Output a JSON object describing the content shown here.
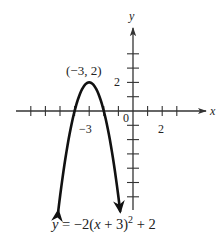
{
  "chart_data": {
    "type": "line",
    "title": "",
    "equation": "y = −2(x + 3)² + 2",
    "equation_parts": {
      "lhs": "y",
      "eq": " = −2(",
      "x": "x",
      "mid": " + 3)",
      "exp": "2",
      "tail": " + 2"
    },
    "function": {
      "a": -2,
      "h": -3,
      "k": 2
    },
    "xlabel": "x",
    "ylabel": "y",
    "xlim": [
      -8,
      5
    ],
    "ylim": [
      -7,
      5
    ],
    "x_ticks": [
      -7,
      -6,
      -5,
      -4,
      -3,
      -2,
      -1,
      1,
      2,
      3
    ],
    "y_ticks": [
      -6,
      -5,
      -4,
      -3,
      -2,
      -1,
      1,
      2,
      3,
      4
    ],
    "x_tick_labels": [
      {
        "value": -3,
        "label": "−3"
      },
      {
        "value": 2,
        "label": "2"
      }
    ],
    "y_tick_labels": [
      {
        "value": 2,
        "label": "2"
      }
    ],
    "origin_label": "0",
    "annotations": [
      {
        "x": -3,
        "y": 2,
        "text": "(−3, 2)"
      }
    ],
    "points": [
      {
        "x": -5.12,
        "y": -7
      },
      {
        "x": -5,
        "y": -6
      },
      {
        "x": -4.5,
        "y": -2.5
      },
      {
        "x": -4,
        "y": 0
      },
      {
        "x": -3.5,
        "y": 1.5
      },
      {
        "x": -3,
        "y": 2
      },
      {
        "x": -2.5,
        "y": 1.5
      },
      {
        "x": -2,
        "y": 0
      },
      {
        "x": -1.5,
        "y": -2.5
      },
      {
        "x": -1,
        "y": -6
      },
      {
        "x": -0.88,
        "y": -7
      }
    ],
    "grid": false,
    "arrows_on_curve_ends": true,
    "colors": {
      "curve": "#111111",
      "axes": "#333333",
      "text": "#222222"
    }
  }
}
